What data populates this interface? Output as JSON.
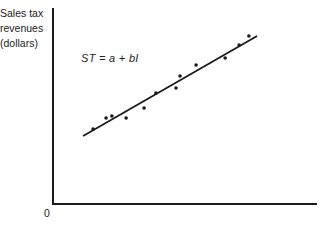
{
  "chart_data": {
    "type": "scatter",
    "title": "",
    "xlabel": "",
    "ylabel": "Sales tax revenues (dollars)",
    "ylabel_lines": [
      "Sales tax",
      "revenues",
      "(dollars)"
    ],
    "origin_label": "0",
    "annotation": "ST = a + bI",
    "xlim": [
      0,
      100
    ],
    "ylim": [
      0,
      100
    ],
    "grid": false,
    "legend": null,
    "units": "normalized axis units (no tick labels shown)",
    "series": [
      {
        "name": "observations",
        "type": "scatter",
        "points": [
          {
            "x": 15.2,
            "y": 38.3
          },
          {
            "x": 20.1,
            "y": 43.9
          },
          {
            "x": 22.3,
            "y": 44.9
          },
          {
            "x": 27.7,
            "y": 43.9
          },
          {
            "x": 34.5,
            "y": 49.0
          },
          {
            "x": 39.0,
            "y": 56.6
          },
          {
            "x": 46.6,
            "y": 59.2
          },
          {
            "x": 48.1,
            "y": 65.3
          },
          {
            "x": 54.2,
            "y": 70.9
          },
          {
            "x": 65.2,
            "y": 74.5
          },
          {
            "x": 70.5,
            "y": 81.1
          },
          {
            "x": 74.2,
            "y": 85.7
          }
        ]
      },
      {
        "name": "regression line",
        "type": "line",
        "points": [
          {
            "x": 11.4,
            "y": 34.7
          },
          {
            "x": 77.3,
            "y": 85.7
          }
        ]
      }
    ]
  },
  "labels": {
    "ylabel_line1": "Sales tax",
    "ylabel_line2": "revenues",
    "ylabel_line3": "(dollars)",
    "origin": "0",
    "formula": "ST = a + bI"
  },
  "colors": {
    "ink": "#1a1a1a",
    "background": "#ffffff"
  }
}
